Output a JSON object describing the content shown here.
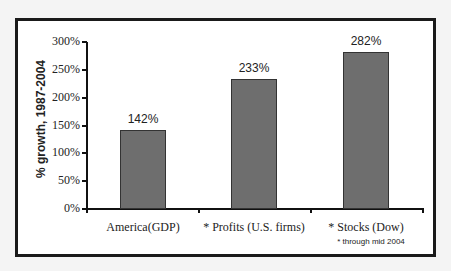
{
  "chart_data": {
    "type": "bar",
    "title": "",
    "xlabel": "",
    "ylabel": "% growth, 1987-2004",
    "categories": [
      "America(GDP)",
      "* Profits (U.S. firms)",
      "* Stocks (Dow)"
    ],
    "values": [
      142,
      233,
      282
    ],
    "value_labels": [
      "142%",
      "233%",
      "282%"
    ],
    "ylim": [
      0,
      300
    ],
    "yticks": [
      "0%",
      "50%",
      "100%",
      "150%",
      "200%",
      "250%",
      "300%"
    ],
    "grid": false,
    "legend": null,
    "annotations": [
      "* through mid 2004"
    ],
    "bar_color": "#6e6e6e"
  }
}
